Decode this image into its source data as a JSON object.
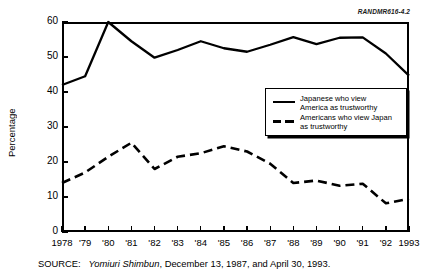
{
  "figure": {
    "id_label": "RANDMR616-4.2",
    "source_prefix": "SOURCE:",
    "source_publication": "Yomiuri Shimbun",
    "source_rest": ", December 13, 1987, and April 30, 1993."
  },
  "legend": {
    "items": [
      {
        "style": "solid",
        "line1": "Japanese who view",
        "line2": "America as trustworthy"
      },
      {
        "style": "dashed",
        "line1": "Americans who view Japan",
        "line2": "as trustworthy"
      }
    ]
  },
  "chart_data": {
    "type": "line",
    "title": "",
    "xlabel": "",
    "ylabel": "Percentage",
    "ylim": [
      0,
      60
    ],
    "yticks": [
      0,
      10,
      20,
      30,
      40,
      50,
      60
    ],
    "ytick_labels": [
      "0",
      "10",
      "20",
      "30",
      "40",
      "50",
      "60"
    ],
    "grid": false,
    "legend_position": "inside-right",
    "x": [
      1978,
      1979,
      1980,
      1981,
      1982,
      1983,
      1984,
      1985,
      1986,
      1987,
      1988,
      1989,
      1990,
      1991,
      1992,
      1993
    ],
    "xtick_labels": [
      "1978",
      "'79",
      "'80",
      "'81",
      "'82",
      "'83",
      "'84",
      "'85",
      "'86",
      "'87",
      "'88",
      "'89",
      "'90",
      "'91",
      "'92",
      "1993"
    ],
    "series": [
      {
        "name": "Japanese who view America as trustworthy",
        "style": "solid",
        "color": "#000000",
        "values": [
          42.0,
          44.5,
          60.0,
          54.5,
          49.8,
          52.0,
          54.5,
          52.5,
          51.5,
          53.5,
          55.7,
          53.7,
          55.5,
          55.6,
          51.0,
          44.7
        ]
      },
      {
        "name": "Americans who view Japan as trustworthy",
        "style": "dashed",
        "color": "#000000",
        "values": [
          14.0,
          17.0,
          21.5,
          25.5,
          18.0,
          21.5,
          22.5,
          24.5,
          23.0,
          19.5,
          14.0,
          14.7,
          13.2,
          13.8,
          8.2,
          9.5
        ]
      }
    ]
  }
}
